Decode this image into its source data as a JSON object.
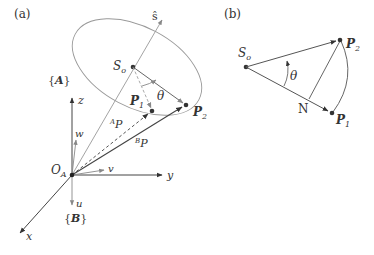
{
  "panel_a": {
    "label": "(a)",
    "axis_s": "ŝ",
    "center": "S",
    "center_sub": "o",
    "frame_A": "{A}",
    "frame_B": "{B}",
    "z": "z",
    "y": "y",
    "x": "x",
    "w": "w",
    "v": "v",
    "u": "u",
    "origin": "O",
    "origin_sub": "A",
    "p1": "P",
    "p1_sub": "1",
    "p2": "P",
    "p2_sub": "2",
    "theta": "θ",
    "ap_sup": "A",
    "ap": "P",
    "bp_sup": "B",
    "bp": "P"
  },
  "panel_b": {
    "label": "(b)",
    "center": "S",
    "center_sub": "o",
    "p1": "P",
    "p1_sub": "1",
    "p2": "P",
    "p2_sub": "2",
    "n": "N",
    "theta": "θ"
  },
  "colors": {
    "line": "#555555",
    "light_line": "#999999",
    "text": "#333333"
  }
}
